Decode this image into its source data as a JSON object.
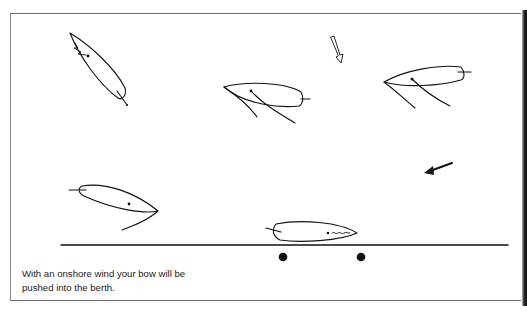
{
  "figure": {
    "caption_lines": [
      "With an onshore wind your bow will be",
      "pushed into the berth."
    ],
    "elements": [
      {
        "name": "boat-1",
        "description": "boat approaching, bow up-left, luffing sail"
      },
      {
        "name": "boat-2",
        "description": "boat heading left with sail and sheets"
      },
      {
        "name": "boat-3",
        "description": "boat heading left with sail and sheets"
      },
      {
        "name": "boat-4",
        "description": "boat heading right with sail curve"
      },
      {
        "name": "boat-berthed",
        "description": "boat alongside berth, sail luffing"
      },
      {
        "name": "wind-arrow-outline",
        "description": "hollow arrow pointing down"
      },
      {
        "name": "wind-arrow-solid",
        "description": "solid arrow pointing down-left"
      },
      {
        "name": "quay-line",
        "description": "berth/shore line"
      },
      {
        "name": "bollards",
        "count": 2
      }
    ],
    "colors": {
      "ink": "#111111",
      "background": "#ffffff",
      "frame": "#6b6b6b"
    }
  }
}
